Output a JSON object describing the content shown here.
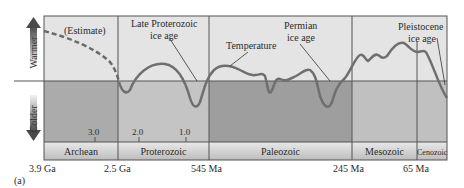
{
  "axis": {
    "warmer_label": "Warmer",
    "colder_label": "Colder"
  },
  "annotations": {
    "estimate": "(Estimate)",
    "late_proterozoic_line1": "Late Proterozoic",
    "late_proterozoic_line2": "ice age",
    "temperature": "Temperature",
    "permian_line1": "Permian",
    "permian_line2": "ice age",
    "pleistocene_line1": "Pleistocene",
    "pleistocene_line2": "ice age"
  },
  "inner_ticks": [
    "3.0",
    "2.0",
    "1.0"
  ],
  "eras": [
    "Archean",
    "Proterozoic",
    "Paleozoic",
    "Mesozoic",
    "Cenozoic"
  ],
  "time_labels": [
    "3.9 Ga",
    "2.5 Ga",
    "545 Ma",
    "245 Ma",
    "65 Ma"
  ],
  "panel_label": "(a)",
  "colors": {
    "warm_bg": "#e6e6e6",
    "cold_bg": "#b4b4b4",
    "cold_bg_dark": "#9a9a9a",
    "curve": "#6f6f6f",
    "frame": "#555555",
    "arrow_dark": "#555555"
  }
}
